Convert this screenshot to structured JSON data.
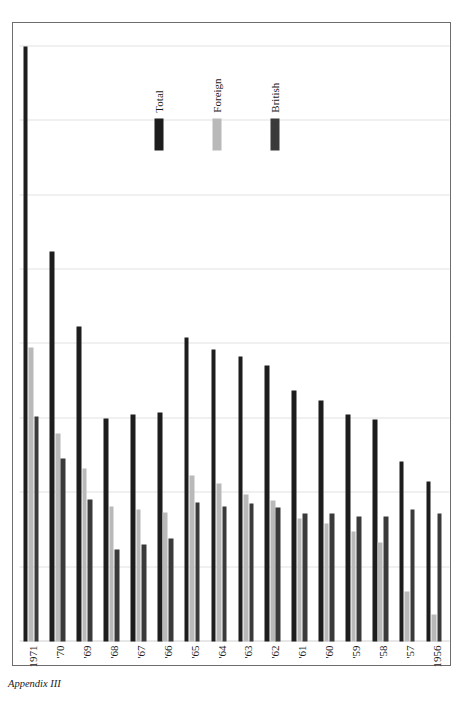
{
  "figure": {
    "caption": "Appendix III",
    "rotation_note": "chart printed rotated 90 degrees on the page"
  },
  "legend": {
    "items": [
      {
        "label": "Total",
        "color": "#1d1d1d",
        "key": "total"
      },
      {
        "label": "Foreign",
        "color": "#b9b9b9",
        "key": "foreign"
      },
      {
        "label": "British",
        "color": "#3a3a3a",
        "key": "british"
      }
    ]
  },
  "chart_data": {
    "type": "bar",
    "orientation": "horizontal",
    "title": "",
    "xlabel": "",
    "ylabel": "Number of Vessels",
    "value_axis_title": "Number of Vessels",
    "ylim": [
      0,
      800
    ],
    "ticks": [
      0,
      100,
      200,
      300,
      400,
      500,
      600,
      700,
      800
    ],
    "tick_labels": [
      "0",
      "100",
      "200",
      "300",
      "400",
      "500",
      "600",
      "700",
      "800"
    ],
    "grid": true,
    "legend_position": "inside-left",
    "categories": [
      "1956",
      "'57",
      "'58",
      "'59",
      "'60",
      "'61",
      "'62",
      "'63",
      "'64",
      "'65",
      "'66",
      "'67",
      "'68",
      "'69",
      "'70",
      "1971"
    ],
    "series": [
      {
        "name": "Total",
        "color": "#1d1d1d",
        "values": [
          215,
          242,
          299,
          305,
          324,
          337,
          371,
          383,
          393,
          409,
          308,
          305,
          300,
          424,
          525,
          800
        ]
      },
      {
        "name": "Foreign",
        "color": "#b9b9b9",
        "values": [
          36,
          67,
          133,
          148,
          159,
          166,
          189,
          198,
          213,
          223,
          174,
          178,
          181,
          233,
          279,
          395
        ]
      },
      {
        "name": "British",
        "color": "#3a3a3a",
        "values": [
          172,
          177,
          168,
          168,
          172,
          172,
          180,
          186,
          182,
          187,
          139,
          130,
          124,
          191,
          246,
          303
        ]
      }
    ]
  }
}
